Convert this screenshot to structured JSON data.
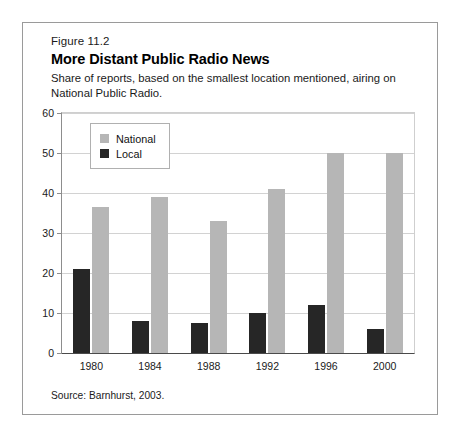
{
  "figure": {
    "number": "Figure 11.2",
    "title": "More Distant Public Radio News",
    "subtitle": "Share of reports, based on the smallest location mentioned, airing on National Public Radio.",
    "source": "Source: Barnhurst, 2003."
  },
  "chart_data": {
    "type": "bar",
    "title": "More Distant Public Radio News",
    "subtitle": "Share of reports, based on the smallest location mentioned, airing on National Public Radio.",
    "xlabel": "",
    "ylabel": "",
    "ylim": [
      0,
      60
    ],
    "yticks": [
      0,
      10,
      20,
      30,
      40,
      50,
      60
    ],
    "ytick_labels": [
      "0",
      "10",
      "20",
      "30",
      "40",
      "50",
      "60"
    ],
    "grid": true,
    "legend_position": "top-left",
    "categories": [
      "1980",
      "1984",
      "1988",
      "1992",
      "1996",
      "2000"
    ],
    "series": [
      {
        "name": "National",
        "color": "#b6b6b6",
        "values": [
          36.5,
          39,
          33,
          41,
          50,
          50
        ]
      },
      {
        "name": "Local",
        "color": "#262626",
        "values": [
          21,
          8,
          7.5,
          10,
          12,
          6
        ]
      }
    ]
  }
}
